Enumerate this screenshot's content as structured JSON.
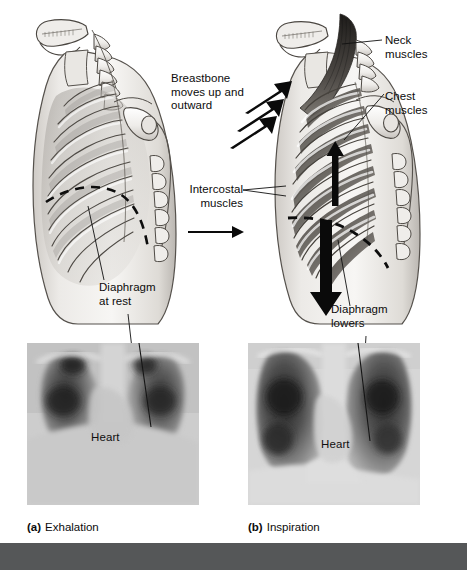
{
  "figure": {
    "background_color": "#ffffff",
    "footer_color": "#555758",
    "text_color": "#0c0c0c"
  },
  "annotations": {
    "breastbone": "Breastbone\nmoves up and\noutward",
    "neck_muscles": "Neck\nmuscles",
    "chest_muscles": "Chest\nmuscles",
    "intercostal_muscles": "Intercostal\nmuscles",
    "diaphragm_at_rest": "Diaphragm\nat rest",
    "diaphragm_lowers": "Diaphragm\nlowers"
  },
  "xrays": {
    "left": {
      "heart_label": "Heart"
    },
    "right": {
      "heart_label": "Heart"
    }
  },
  "captions": {
    "a": {
      "marker": "(a)",
      "text": "Exhalation"
    },
    "b": {
      "marker": "(b)",
      "text": "Inspiration"
    }
  }
}
